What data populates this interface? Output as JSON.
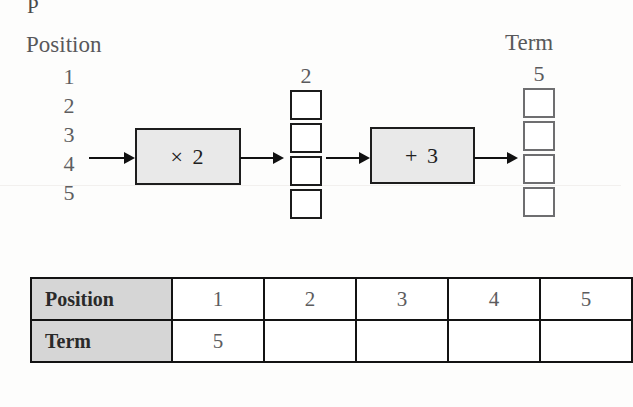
{
  "worksheet": {
    "scan_artifact": "P",
    "position_label": "Position",
    "term_label": "Term",
    "positions": [
      "1",
      "2",
      "3",
      "4",
      "5"
    ],
    "machines": [
      {
        "operation": "× 2"
      },
      {
        "operation": "+ 3"
      }
    ],
    "intermediate_column": {
      "value": "2",
      "empty_boxes": 4
    },
    "term_column": {
      "value": "5",
      "empty_boxes": 4
    },
    "arrows": [
      "arrow-input",
      "arrow-after-times2",
      "arrow-before-plus3",
      "arrow-output"
    ],
    "colors": {
      "machine_fill": "#e9e9e9",
      "header_cell_fill": "#d6d6d6",
      "border_dark": "#131313",
      "text_gray": "#5c5c5e",
      "page_background": "#fdfdfc"
    }
  },
  "table": {
    "rows": [
      {
        "header": "Position",
        "cells": [
          "1",
          "2",
          "3",
          "4",
          "5"
        ]
      },
      {
        "header": "Term",
        "cells": [
          "5",
          "",
          "",
          "",
          ""
        ]
      }
    ]
  }
}
